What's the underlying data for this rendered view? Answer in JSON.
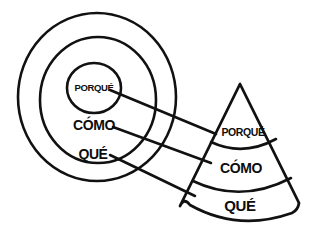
{
  "diagram": {
    "style": {
      "background_color": "#ffffff",
      "ink_color": "#111111",
      "text_color": "#0d0d0d"
    },
    "circles": {
      "name": "concentric-circles",
      "labels": {
        "inner": "PORQUÉ",
        "middle": "CÓMO",
        "outer": "QUÉ"
      }
    },
    "cone": {
      "name": "layered-cone",
      "labels": {
        "top": "PORQUÉ",
        "middle": "CÓMO",
        "bottom": "QUÉ"
      }
    },
    "connectors": {
      "count": 3,
      "pairs": [
        {
          "from": "PORQUÉ",
          "to": "PORQUÉ"
        },
        {
          "from": "CÓMO",
          "to": "CÓMO"
        },
        {
          "from": "QUÉ",
          "to": "QUÉ"
        }
      ]
    }
  }
}
